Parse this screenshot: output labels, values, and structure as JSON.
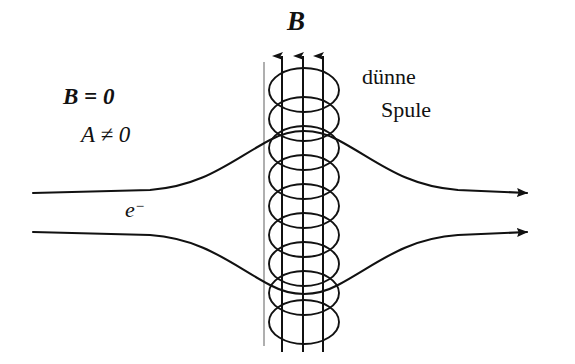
{
  "figure": {
    "background_color": "#ffffff",
    "ink_color": "#111111",
    "width": 575,
    "height": 364
  },
  "labels": {
    "magnetic_field": "B",
    "field_zero": "B = 0",
    "potential_nonzero": "A ≠ 0",
    "coil_line_1": "dünne",
    "coil_line_2": "Spule",
    "electron_symbol": "e",
    "electron_charge_sign": "−"
  },
  "solenoid": {
    "center_x": 304,
    "ellipse_rx": 35,
    "ellipse_ry": 22,
    "turn_count": 9,
    "turn_spacing": 29,
    "first_turn_cy": 90,
    "field_line_xs": [
      264,
      282,
      303,
      323
    ],
    "field_line_top": 54,
    "field_line_bottom": 352,
    "arrow_line_xs": [
      282,
      303,
      323
    ],
    "thin_guide_line_x": 264
  },
  "beams": {
    "upper": {
      "start_x": 33,
      "start_y": 193,
      "end_x": 541,
      "end_y": 193,
      "peak_y": 133,
      "has_arrowhead": true
    },
    "lower": {
      "start_x": 33,
      "start_y": 232,
      "end_x": 541,
      "end_y": 232,
      "peak_y": 291,
      "has_arrowhead": true
    }
  }
}
